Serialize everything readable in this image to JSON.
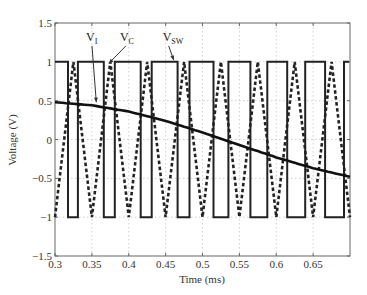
{
  "chart_data": {
    "type": "line",
    "title": "",
    "xlabel": "Time (ms)",
    "ylabel": "Voltage (V)",
    "xlim": [
      0.3,
      0.7
    ],
    "ylim": [
      -1.5,
      1.5
    ],
    "xticks": [
      0.3,
      0.35,
      0.4,
      0.45,
      0.5,
      0.55,
      0.6,
      0.65
    ],
    "xtick_labels": [
      "0.3",
      "0.35",
      "0.4",
      "0.45",
      "0.5",
      "0.55",
      "0.6",
      "0.65"
    ],
    "yticks": [
      -1.5,
      -1,
      -0.5,
      0,
      0.5,
      1,
      1.5
    ],
    "ytick_labels": [
      "-1.5",
      "-1",
      "-0.5",
      "0",
      "0.5",
      "1",
      "1.5"
    ],
    "grid": true,
    "legend": "none (inline annotations with arrows)",
    "series": [
      {
        "name": "V_I",
        "style": "solid thick",
        "description": "slowly decreasing reference voltage (sinusoid segment)",
        "x": [
          0.3,
          0.35,
          0.4,
          0.45,
          0.5,
          0.55,
          0.6,
          0.65,
          0.7
        ],
        "y": [
          0.48,
          0.44,
          0.36,
          0.24,
          0.09,
          -0.07,
          -0.23,
          -0.37,
          -0.48
        ]
      },
      {
        "name": "V_C",
        "style": "dashed thick",
        "description": "triangle carrier between -1 and 1, period 0.05 ms",
        "x": [
          0.3,
          0.325,
          0.35,
          0.375,
          0.4,
          0.425,
          0.45,
          0.475,
          0.5,
          0.525,
          0.55,
          0.575,
          0.6,
          0.625,
          0.65,
          0.675,
          0.7
        ],
        "y": [
          -1,
          1,
          -1,
          1,
          -1,
          1,
          -1,
          1,
          -1,
          1,
          -1,
          1,
          -1,
          1,
          -1,
          1,
          -1
        ]
      },
      {
        "name": "V_SW",
        "style": "solid",
        "description": "switching square wave, +1 when V_C < V_I else -1",
        "edges_ms": [
          0.3,
          0.3176,
          0.3311,
          0.3662,
          0.3811,
          0.4162,
          0.4311,
          0.4662,
          0.4824,
          0.5149,
          0.5351,
          0.5649,
          0.5878,
          0.6149,
          0.6392,
          0.6662,
          0.6919,
          0.6986
        ],
        "levels": [
          1,
          -1,
          1,
          -1,
          1,
          -1,
          1,
          -1,
          1,
          -1,
          1,
          -1,
          1,
          -1,
          1,
          -1,
          1
        ]
      }
    ],
    "annotations": [
      {
        "text": "V",
        "sub": "I",
        "label_x_ms": 0.342,
        "label_y_V": 1.27,
        "arrow_to_ms": 0.356,
        "arrow_to_V": 0.48
      },
      {
        "text": "V",
        "sub": "C",
        "label_x_ms": 0.388,
        "label_y_V": 1.27,
        "arrow_to_ms": 0.373,
        "arrow_to_V": 0.98
      },
      {
        "text": "V",
        "sub": "SW",
        "label_x_ms": 0.446,
        "label_y_V": 1.27,
        "arrow_to_ms": 0.461,
        "arrow_to_V": 1.02
      }
    ]
  }
}
